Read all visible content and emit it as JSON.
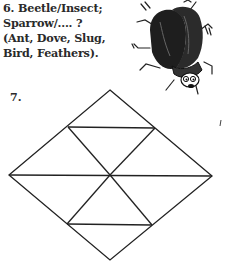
{
  "question6": {
    "number": "6.",
    "lines": [
      "6. Beetle/Insect;",
      "Sparrow/.... ?",
      "(Ant, Dove, Slug,",
      "Bird, Feathers)."
    ],
    "illustration": "beetle-illustration"
  },
  "question7": {
    "label": "7.",
    "figure": {
      "type": "diamond-triangle-grid",
      "vertices": {
        "top": [
          110,
          90
        ],
        "left": [
          9,
          175
        ],
        "right": [
          212,
          176
        ],
        "bottom": [
          110,
          260
        ],
        "center": [
          110,
          175
        ],
        "upper_left": [
          68,
          127
        ],
        "upper_right": [
          155,
          128
        ],
        "lower_left": [
          67,
          224
        ],
        "lower_right": [
          152,
          225
        ]
      },
      "stroke_color": "#222222"
    }
  },
  "colors": {
    "text": "#2a2a2a",
    "background": "#ffffff",
    "ink": "#222222"
  }
}
